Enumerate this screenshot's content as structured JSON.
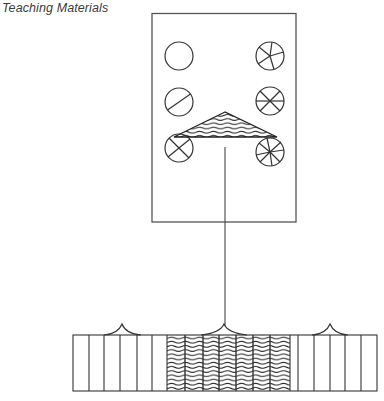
{
  "header": {
    "title": "Teaching Materials"
  },
  "colors": {
    "ink": "#3a3a3a",
    "background": "#ffffff"
  },
  "diagram": {
    "panel": {
      "description": "Rectangular board containing six divided circles and a wave-hatched triangle",
      "circles": [
        {
          "position": "left-top",
          "divisions": 1,
          "label": "whole circle"
        },
        {
          "position": "left-middle",
          "divisions": 2,
          "label": "circle divided into halves"
        },
        {
          "position": "left-bottom",
          "divisions": 4,
          "label": "circle divided into quarters"
        },
        {
          "position": "right-top",
          "divisions": 5,
          "label": "circle divided into fifths"
        },
        {
          "position": "right-middle",
          "divisions": 6,
          "label": "circle divided into sixths"
        },
        {
          "position": "right-bottom",
          "divisions": 8,
          "label": "circle divided into eighths"
        }
      ],
      "triangle": {
        "fill": "wave-hatch"
      }
    },
    "connector": {
      "description": "vertical line from triangle to strip"
    },
    "strip": {
      "description": "Segmented strip in three sections; middle section wave-hatched",
      "sections": [
        {
          "position": "left",
          "segments": 6,
          "fill": "plain"
        },
        {
          "position": "middle",
          "segments": 7,
          "fill": "wave-hatch"
        },
        {
          "position": "right",
          "segments": 6,
          "fill": "plain"
        }
      ],
      "cusps": 3
    }
  }
}
